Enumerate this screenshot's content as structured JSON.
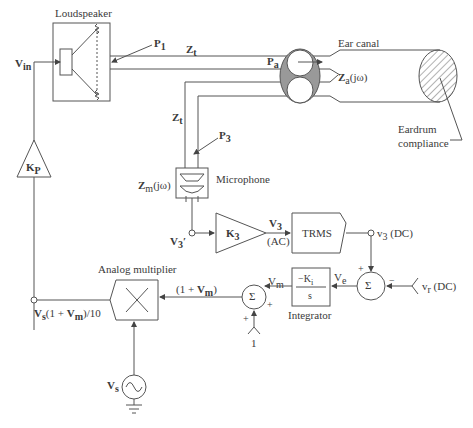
{
  "diagram": {
    "nodes": {
      "loudspeaker": {
        "label": "Loudspeaker"
      },
      "ear_canal": {
        "label": "Ear canal"
      },
      "eardrum": {
        "label_line1": "Eardrum",
        "label_line2": "compliance"
      },
      "microphone": {
        "label": "Microphone"
      },
      "trms": {
        "label": "TRMS"
      },
      "integrator": {
        "label": "Integrator",
        "numerator": "−K",
        "numerator_sub": "i",
        "denominator": "s"
      },
      "analog_multiplier": {
        "label": "Analog multiplier"
      },
      "amp_kp": {
        "label": "K",
        "sub": "P"
      },
      "amp_k3": {
        "label": "K",
        "sub": "3"
      },
      "sum_error": {
        "label": "Σ",
        "plus": "+",
        "minus": "−"
      },
      "sum_mod": {
        "label": "Σ",
        "plus_top": "+",
        "plus_left": "+"
      },
      "source_vs": {
        "label": "V",
        "sub": "s"
      }
    },
    "signals": {
      "vin": {
        "main": "V",
        "sub": "in"
      },
      "p1": {
        "main": "P",
        "sub": "1"
      },
      "pa": {
        "main": "P",
        "sub": "a"
      },
      "p3": {
        "main": "P",
        "sub": "3"
      },
      "zt_top": {
        "main": "Z",
        "sub": "t"
      },
      "zt_left": {
        "main": "Z",
        "sub": "t"
      },
      "za": {
        "main": "Z",
        "sub": "a",
        "rest": "(jω)"
      },
      "zm": {
        "main": "Z",
        "sub": "m",
        "rest": "(jω)"
      },
      "v3_prime": {
        "main": "V",
        "sub": "3",
        "rest": "′"
      },
      "v3_ac": {
        "main": "V",
        "sub": "3",
        "note": "(AC)"
      },
      "v3_dc": {
        "main": "v",
        "sub": "3",
        "rest": " (DC)"
      },
      "vr_dc": {
        "main": "v",
        "sub": "r",
        "rest": " (DC)"
      },
      "ve": {
        "main": "V",
        "sub": "e"
      },
      "vm": {
        "main": "V",
        "sub": "m"
      },
      "one_plus_vm": {
        "pre": "(1 + ",
        "main": "V",
        "sub": "m",
        "post": ")"
      },
      "one": {
        "label": "1"
      },
      "output": {
        "main": "V",
        "sub": "s",
        "mid": "(1 + ",
        "main2": "V",
        "sub2": "m",
        "post": ")/10"
      }
    }
  }
}
